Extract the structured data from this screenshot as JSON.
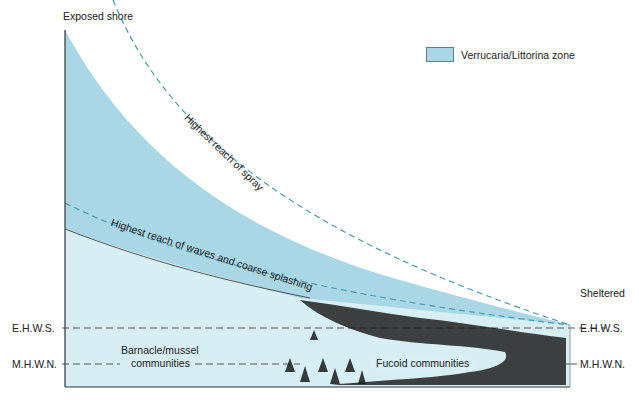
{
  "labels": {
    "exposed": "Exposed shore",
    "sheltered": "Sheltered",
    "ehws_left": "E.H.W.S.",
    "ehws_right": "E.H.W.S.",
    "mhwn_left": "M.H.W.N.",
    "mhwn_right": "M.H.W.N.",
    "barnacle_1": "Barnacle/mussel",
    "barnacle_2": "communities",
    "fucoid": "Fucoid communities",
    "spray": "Highest reach of spray",
    "waves": "Highest reach of waves and coarse splashing"
  },
  "legend": {
    "label": "Verrucaria/Littorina zone",
    "color": "#a9d7e5"
  },
  "colors": {
    "verrucaria_zone": "#a9d7e5",
    "lower_shore": "#d8eef5",
    "dashed_blue": "#4a9ab5",
    "dashed_grey": "#555555",
    "axis": "#333333"
  }
}
